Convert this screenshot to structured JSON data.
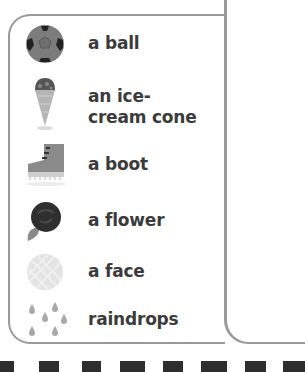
{
  "list": {
    "items": [
      {
        "icon": "soccer-ball-icon",
        "label": "a ball"
      },
      {
        "icon": "ice-cream-cone-icon",
        "label": "an ice-cream cone"
      },
      {
        "icon": "boot-icon",
        "label": "a boot"
      },
      {
        "icon": "rose-flower-icon",
        "label": "a flower"
      },
      {
        "icon": "face-icon",
        "label": "a face"
      },
      {
        "icon": "raindrops-icon",
        "label": "raindrops"
      }
    ]
  },
  "colors": {
    "border": "#9a9a9a",
    "text": "#3b3b3b",
    "squares": "#2e2e2e"
  }
}
